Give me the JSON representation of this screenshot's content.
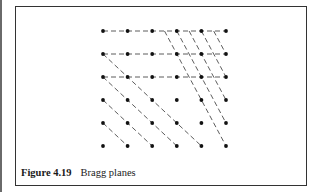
{
  "figure": {
    "label": "Figure 4.19",
    "title": "Bragg planes"
  },
  "lattice": {
    "columns": 6,
    "rows": 6,
    "origin_x": 103,
    "origin_y": 31,
    "spacing_x": 24.6,
    "spacing_y": 23.0,
    "dot_color": "#111111",
    "line_color": "#333333"
  },
  "plane_families": [
    {
      "name": "horizontal-planes",
      "direction": "horizontal",
      "rows": [
        0,
        1,
        2
      ]
    },
    {
      "name": "diagonal-planes",
      "direction": "one column right per row down",
      "start_points": [
        [
          0,
          1
        ],
        [
          0,
          2
        ],
        [
          0,
          3
        ],
        [
          0,
          4
        ]
      ]
    },
    {
      "name": "steep-planes",
      "direction": "one column right per two rows down",
      "start_x_cols": [
        2.5,
        3,
        3.5,
        4,
        4.5
      ]
    }
  ]
}
